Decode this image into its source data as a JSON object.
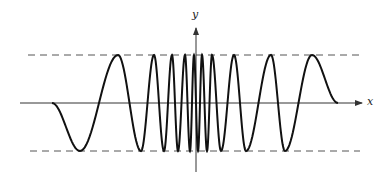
{
  "figure": {
    "x_axis_label": "x",
    "y_axis_label": "y",
    "colors": {
      "curve": "#111111",
      "axis": "#333333",
      "dashed": "#555555",
      "background": "#ffffff"
    }
  },
  "layout": {
    "x_axis": {
      "y": 103,
      "x_start": 20,
      "x_end": 362
    },
    "y_axis": {
      "x": 196,
      "y_top": 28,
      "y_bottom": 172
    },
    "upper_bound": {
      "y": 55,
      "x_start": 28,
      "x_end": 360
    },
    "lower_bound": {
      "y": 151,
      "x_start": 30,
      "x_end": 360
    }
  },
  "chart_data": {
    "type": "line",
    "title": "",
    "xlabel": "x",
    "ylabel": "y",
    "bounds": [
      -1,
      1
    ],
    "grid": false,
    "extrema_pixels": [
      [
        52,
        103
      ],
      [
        80,
        151
      ],
      [
        118,
        55
      ],
      [
        141,
        151
      ],
      [
        154,
        55
      ],
      [
        164,
        151
      ],
      [
        172,
        55
      ],
      [
        178,
        151
      ],
      [
        185,
        55
      ],
      [
        190,
        151
      ],
      [
        194,
        55
      ],
      [
        198,
        151
      ],
      [
        202,
        55
      ],
      [
        207,
        151
      ],
      [
        212,
        55
      ],
      [
        221,
        151
      ],
      [
        234,
        55
      ],
      [
        246,
        151
      ],
      [
        271,
        55
      ],
      [
        285,
        151
      ],
      [
        312,
        55
      ],
      [
        338,
        103
      ]
    ]
  }
}
